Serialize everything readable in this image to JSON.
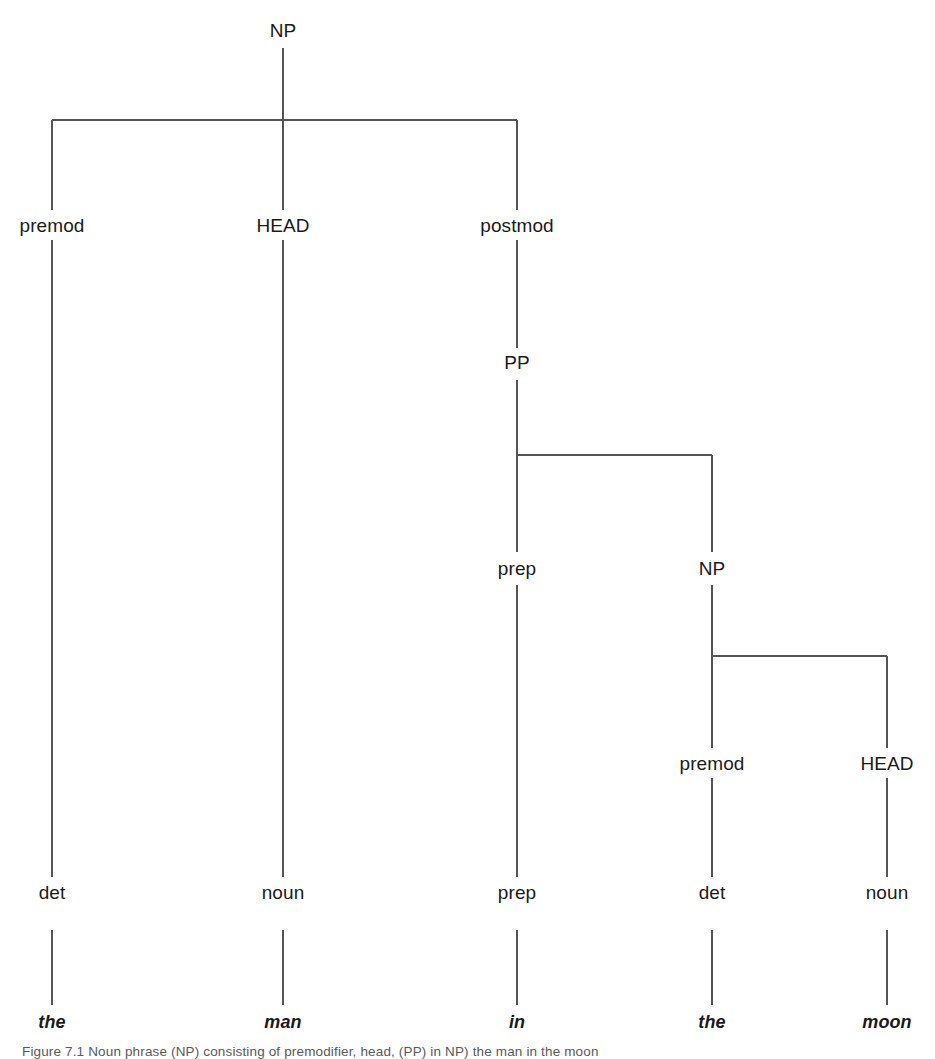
{
  "figure": {
    "type": "syntax-tree",
    "line_color": "#555555",
    "text_color": "#1a1a1a",
    "background": "#ffffff",
    "sentence": "the man in the moon"
  },
  "nodes": [
    {
      "id": "np-root",
      "label": "NP",
      "x": 283,
      "y": 30,
      "level": 0
    },
    {
      "id": "premod-1",
      "label": "premod",
      "x": 52,
      "y": 225,
      "level": 1
    },
    {
      "id": "head-1",
      "label": "HEAD",
      "x": 283,
      "y": 225,
      "level": 1
    },
    {
      "id": "postmod-1",
      "label": "postmod",
      "x": 517,
      "y": 225,
      "level": 1
    },
    {
      "id": "pp",
      "label": "PP",
      "x": 517,
      "y": 362,
      "level": 2
    },
    {
      "id": "prep-fn",
      "label": "prep",
      "x": 517,
      "y": 568,
      "level": 3
    },
    {
      "id": "np-embedded",
      "label": "NP",
      "x": 712,
      "y": 568,
      "level": 3
    },
    {
      "id": "premod-2",
      "label": "premod",
      "x": 712,
      "y": 763,
      "level": 4
    },
    {
      "id": "head-2",
      "label": "HEAD",
      "x": 887,
      "y": 763,
      "level": 4
    },
    {
      "id": "pos-det-1",
      "label": "det",
      "x": 52,
      "y": 892,
      "level": 5
    },
    {
      "id": "pos-noun-1",
      "label": "noun",
      "x": 283,
      "y": 892,
      "level": 5
    },
    {
      "id": "pos-prep",
      "label": "prep",
      "x": 517,
      "y": 892,
      "level": 5
    },
    {
      "id": "pos-det-2",
      "label": "det",
      "x": 712,
      "y": 892,
      "level": 5
    },
    {
      "id": "pos-noun-2",
      "label": "noun",
      "x": 887,
      "y": 892,
      "level": 5
    }
  ],
  "terminals": [
    {
      "id": "word-the-1",
      "label": "the",
      "x": 52,
      "y": 1022
    },
    {
      "id": "word-man",
      "label": "man",
      "x": 283,
      "y": 1022
    },
    {
      "id": "word-in",
      "label": "in",
      "x": 517,
      "y": 1022
    },
    {
      "id": "word-the-2",
      "label": "the",
      "x": 712,
      "y": 1022
    },
    {
      "id": "word-moon",
      "label": "moon",
      "x": 887,
      "y": 1022
    }
  ],
  "edges": {
    "verticals": [
      {
        "id": "v-np-root-stem",
        "x": 283,
        "y1": 48,
        "y2": 120
      },
      {
        "id": "v-premod-1",
        "x": 52,
        "y1": 120,
        "y2": 210
      },
      {
        "id": "v-head-1",
        "x": 283,
        "y1": 120,
        "y2": 210
      },
      {
        "id": "v-postmod-1",
        "x": 517,
        "y1": 120,
        "y2": 210
      },
      {
        "id": "v-postmod-to-pp",
        "x": 517,
        "y1": 240,
        "y2": 348
      },
      {
        "id": "v-pp-stem",
        "x": 517,
        "y1": 380,
        "y2": 455
      },
      {
        "id": "v-prep-fn",
        "x": 517,
        "y1": 455,
        "y2": 552
      },
      {
        "id": "v-np-embedded",
        "x": 712,
        "y1": 455,
        "y2": 552
      },
      {
        "id": "v-np-emb-stem",
        "x": 712,
        "y1": 585,
        "y2": 656
      },
      {
        "id": "v-premod-2",
        "x": 712,
        "y1": 656,
        "y2": 748
      },
      {
        "id": "v-head-2",
        "x": 887,
        "y1": 656,
        "y2": 748
      },
      {
        "id": "v-premod1-to-det",
        "x": 52,
        "y1": 240,
        "y2": 877
      },
      {
        "id": "v-head1-to-noun",
        "x": 283,
        "y1": 240,
        "y2": 877
      },
      {
        "id": "v-prepfn-to-prep",
        "x": 517,
        "y1": 585,
        "y2": 877
      },
      {
        "id": "v-premod2-to-det",
        "x": 712,
        "y1": 778,
        "y2": 877
      },
      {
        "id": "v-head2-to-noun",
        "x": 887,
        "y1": 778,
        "y2": 877
      },
      {
        "id": "v-det1-to-the",
        "x": 52,
        "y1": 930,
        "y2": 1005
      },
      {
        "id": "v-noun1-to-man",
        "x": 283,
        "y1": 930,
        "y2": 1005
      },
      {
        "id": "v-prep-to-in",
        "x": 517,
        "y1": 930,
        "y2": 1005
      },
      {
        "id": "v-det2-to-the",
        "x": 712,
        "y1": 930,
        "y2": 1005
      },
      {
        "id": "v-noun2-to-moon",
        "x": 887,
        "y1": 930,
        "y2": 1005
      }
    ],
    "horizontals": [
      {
        "id": "h-np-root",
        "y": 120,
        "x1": 52,
        "x2": 517
      },
      {
        "id": "h-pp",
        "y": 455,
        "x1": 517,
        "x2": 712
      },
      {
        "id": "h-np-embedded",
        "y": 656,
        "x1": 712,
        "x2": 887
      }
    ]
  },
  "caption": {
    "text": "Figure 7.1  Noun phrase (NP) consisting of premodifier, head, (PP) in NP) the man in the moon"
  }
}
